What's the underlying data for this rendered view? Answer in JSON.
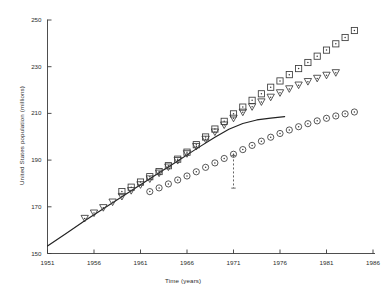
{
  "chart_data": {
    "type": "scatter",
    "title": "",
    "subtitle": "",
    "xlabel": "Time (years)",
    "ylabel": "United States population (millions)",
    "xlim": [
      1951,
      1986
    ],
    "ylim": [
      150,
      250
    ],
    "xticks": [
      1951,
      1956,
      1961,
      1966,
      1971,
      1976,
      1981,
      1986
    ],
    "xticklabels": [
      "1951",
      "1956",
      "1961",
      "1966",
      "1971",
      "1976",
      "1981",
      "1986"
    ],
    "yticks": [
      150,
      170,
      190,
      210,
      230,
      250
    ],
    "yticklabels": [
      "150",
      "170",
      "190",
      "210",
      "230",
      "250"
    ],
    "grid": false,
    "legend": "none",
    "annotations": [
      {
        "name": "vertical-dashed-marker",
        "type": "vline",
        "x": 1971,
        "y0": 178,
        "y1": 192,
        "style": "dashed"
      }
    ],
    "series": [
      {
        "name": "high-projection",
        "marker": "square",
        "color": "#3a3a3a",
        "x": [
          1959,
          1960,
          1961,
          1962,
          1963,
          1964,
          1965,
          1966,
          1967,
          1968,
          1969,
          1970,
          1971,
          1972,
          1973,
          1974,
          1975,
          1976,
          1977,
          1978,
          1979,
          1980,
          1981,
          1982,
          1983,
          1984
        ],
        "y": [
          176.5,
          178.4,
          180.6,
          182.9,
          185.1,
          187.6,
          190.4,
          193.4,
          196.6,
          199.9,
          203.3,
          206.6,
          209.8,
          212.7,
          215.6,
          218.4,
          221.2,
          223.9,
          226.6,
          229.2,
          231.8,
          234.5,
          237.1,
          239.8,
          242.5,
          245.5
        ]
      },
      {
        "name": "medium-projection",
        "marker": "triangle-down",
        "color": "#3a3a3a",
        "x": [
          1955,
          1956,
          1957,
          1958,
          1959,
          1960,
          1961,
          1962,
          1963,
          1964,
          1965,
          1966,
          1967,
          1968,
          1969,
          1970,
          1971,
          1972,
          1973,
          1974,
          1975,
          1976,
          1977,
          1978,
          1979,
          1980,
          1981,
          1982
        ],
        "y": [
          165.0,
          167.3,
          169.6,
          172.0,
          174.4,
          176.9,
          179.4,
          181.9,
          184.4,
          187.0,
          189.8,
          192.7,
          195.8,
          198.9,
          202.0,
          205.0,
          207.9,
          210.5,
          212.8,
          214.9,
          216.9,
          218.8,
          220.5,
          222.1,
          223.6,
          225.0,
          226.3,
          227.4
        ]
      },
      {
        "name": "low-projection",
        "marker": "circle",
        "color": "#3a3a3a",
        "x": [
          1962,
          1963,
          1964,
          1965,
          1966,
          1967,
          1968,
          1969,
          1970,
          1971,
          1972,
          1973,
          1974,
          1975,
          1976,
          1977,
          1978,
          1979,
          1980,
          1981,
          1982,
          1983,
          1984
        ],
        "y": [
          176.5,
          178.1,
          179.8,
          181.5,
          183.2,
          185.0,
          186.9,
          188.8,
          190.7,
          192.5,
          194.5,
          196.3,
          198.1,
          199.8,
          201.4,
          202.9,
          204.3,
          205.6,
          206.8,
          207.9,
          208.9,
          209.8,
          210.6
        ]
      }
    ],
    "curves": [
      {
        "name": "fitted-curve",
        "style": "solid",
        "color": "#222222",
        "x": [
          1951,
          1953,
          1955,
          1957,
          1959,
          1961,
          1963,
          1965,
          1967,
          1969,
          1970.5,
          1972,
          1973.5,
          1975,
          1976.5
        ],
        "y": [
          153.2,
          158.6,
          164.0,
          169.2,
          174.3,
          179.4,
          184.6,
          189.6,
          194.8,
          199.8,
          203.2,
          205.7,
          207.2,
          208.0,
          208.6
        ]
      }
    ]
  }
}
